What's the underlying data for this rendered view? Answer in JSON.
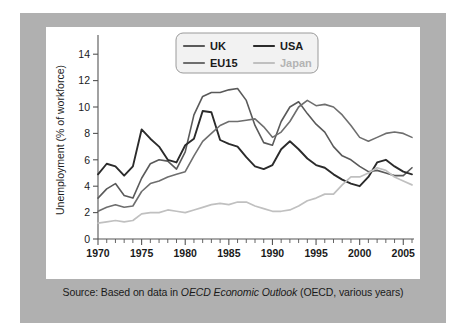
{
  "caption": {
    "prefix": "Source: Based on data in ",
    "italic": "OECD Economic Outlook",
    "suffix": " (OECD, various years)"
  },
  "chart_data": {
    "type": "line",
    "title": "",
    "xlabel": "",
    "ylabel": "Unemployment (% of workforce)",
    "xlim": [
      1970,
      2006
    ],
    "ylim": [
      0,
      15
    ],
    "yticks": [
      0,
      2,
      4,
      6,
      8,
      10,
      12,
      14
    ],
    "xticks": [
      1970,
      1975,
      1980,
      1985,
      1990,
      1995,
      2000,
      2005
    ],
    "xtick_minor_step": 1,
    "grid": false,
    "legend_position": "top-center",
    "x": [
      1970,
      1971,
      1972,
      1973,
      1974,
      1975,
      1976,
      1977,
      1978,
      1979,
      1980,
      1981,
      1982,
      1983,
      1984,
      1985,
      1986,
      1987,
      1988,
      1989,
      1990,
      1991,
      1992,
      1993,
      1994,
      1995,
      1996,
      1997,
      1998,
      1999,
      2000,
      2001,
      2002,
      2003,
      2004,
      2005,
      2006
    ],
    "series": [
      {
        "name": "UK",
        "color": "#5a5a5a",
        "width": 1.6,
        "values": [
          3.1,
          3.8,
          4.2,
          3.3,
          3.1,
          4.6,
          5.7,
          6.0,
          5.9,
          5.3,
          6.6,
          9.4,
          10.8,
          11.1,
          11.1,
          11.3,
          11.4,
          10.5,
          8.6,
          7.3,
          7.1,
          8.9,
          10.0,
          10.4,
          9.5,
          8.7,
          8.1,
          7.0,
          6.3,
          6.0,
          5.5,
          5.1,
          5.2,
          5.0,
          4.8,
          4.8,
          5.4
        ]
      },
      {
        "name": "USA",
        "color": "#2b2b2b",
        "width": 1.9,
        "values": [
          4.9,
          5.7,
          5.5,
          4.8,
          5.5,
          8.3,
          7.6,
          7.0,
          6.0,
          5.8,
          7.1,
          7.6,
          9.7,
          9.6,
          7.5,
          7.2,
          7.0,
          6.2,
          5.5,
          5.3,
          5.6,
          6.8,
          7.4,
          6.8,
          6.1,
          5.6,
          5.4,
          4.9,
          4.5,
          4.2,
          4.0,
          4.7,
          5.8,
          6.0,
          5.5,
          5.1,
          4.9
        ]
      },
      {
        "name": "EU15",
        "color": "#6e6e6e",
        "width": 1.6,
        "values": [
          2.1,
          2.4,
          2.6,
          2.4,
          2.5,
          3.6,
          4.2,
          4.4,
          4.7,
          4.9,
          5.1,
          6.3,
          7.4,
          8.0,
          8.6,
          8.9,
          8.9,
          9.0,
          9.1,
          8.5,
          7.7,
          8.1,
          8.9,
          10.0,
          10.5,
          10.1,
          10.2,
          10.0,
          9.4,
          8.6,
          7.7,
          7.4,
          7.7,
          8.0,
          8.1,
          8.0,
          7.7
        ]
      },
      {
        "name": "Japan",
        "color": "#c0c0c0",
        "width": 1.7,
        "values": [
          1.2,
          1.3,
          1.4,
          1.3,
          1.4,
          1.9,
          2.0,
          2.0,
          2.2,
          2.1,
          2.0,
          2.2,
          2.4,
          2.6,
          2.7,
          2.6,
          2.8,
          2.8,
          2.5,
          2.3,
          2.1,
          2.1,
          2.2,
          2.5,
          2.9,
          3.1,
          3.4,
          3.4,
          4.1,
          4.7,
          4.7,
          5.0,
          5.4,
          5.2,
          4.7,
          4.4,
          4.1
        ]
      }
    ]
  },
  "legend": {
    "entries": [
      {
        "label": "UK",
        "color": "#5a5a5a",
        "text_color": "#1a1a1a"
      },
      {
        "label": "USA",
        "color": "#2b2b2b",
        "text_color": "#1a1a1a"
      },
      {
        "label": "EU15",
        "color": "#6e6e6e",
        "text_color": "#1a1a1a"
      },
      {
        "label": "Japan",
        "color": "#c0c0c0",
        "text_color": "#b4b4b4"
      }
    ]
  },
  "colors": {
    "figure_border": "#b0b0b0",
    "panel_background": "#ffffff",
    "axis": "#555555",
    "text": "#1a1a1a"
  }
}
